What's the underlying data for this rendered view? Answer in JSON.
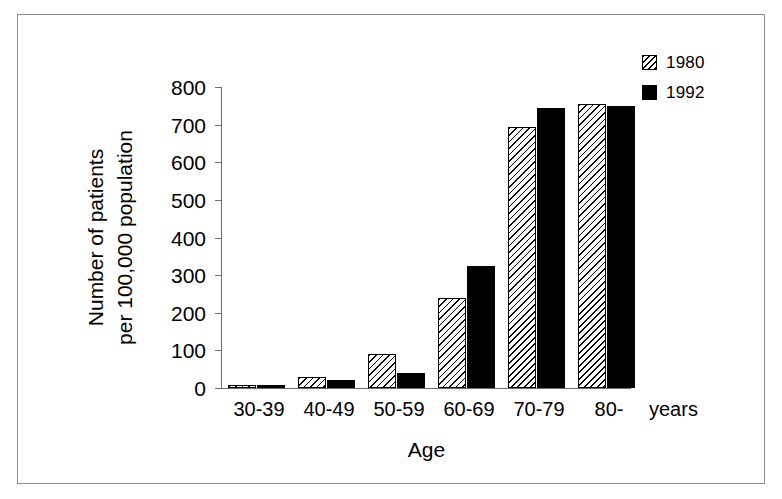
{
  "chart_data": {
    "type": "bar",
    "title": "",
    "subtitle": "",
    "xlabel": "Age",
    "ylabel": "Number of patients per 100,000 population",
    "ylabel_lines": [
      "Number of patients",
      "per 100,000 population"
    ],
    "x_unit_label": "years",
    "categories": [
      "30-39",
      "40-49",
      "50-59",
      "60-69",
      "70-79",
      "80-"
    ],
    "series": [
      {
        "name": "1980",
        "style": "hatched",
        "values": [
          8,
          30,
          90,
          240,
          695,
          755
        ]
      },
      {
        "name": "1992",
        "style": "solid",
        "values": [
          8,
          20,
          40,
          325,
          745,
          750
        ]
      }
    ],
    "ylim": [
      0,
      800
    ],
    "y_ticks": [
      0,
      100,
      200,
      300,
      400,
      500,
      600,
      700,
      800
    ],
    "y_tick_labels": [
      "0",
      "100",
      "200",
      "300",
      "400",
      "500",
      "600",
      "700",
      "800"
    ],
    "grid": false,
    "legend_position": "top-right",
    "colors": {
      "series_1980": "#ffffff",
      "series_1992": "#000000",
      "axis": "#6d6d6d",
      "frame": "#8e8e8e",
      "text": "#000000",
      "background": "#ffffff"
    }
  },
  "legend": {
    "entries": [
      {
        "label": "1980",
        "swatch": "hatched-swatch-icon"
      },
      {
        "label": "1992",
        "swatch": "solid-swatch-icon"
      }
    ]
  }
}
